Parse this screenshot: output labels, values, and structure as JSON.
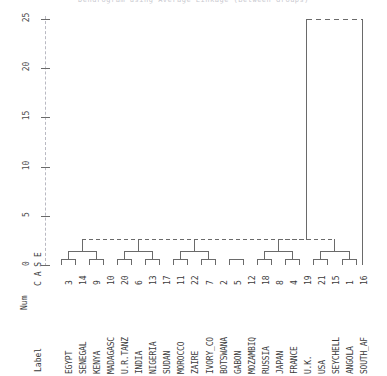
{
  "title": "Dendrogram using Average Linkage (Between Groups)",
  "header": {
    "case_label": "C A S E",
    "label_col": "Label",
    "num_col": "Num"
  },
  "chart_data": {
    "type": "dendrogram",
    "title": "Dendrogram using Average Linkage (Between Groups)",
    "xlabel": "Rescaled Distance Cluster Combine",
    "ylabel": "",
    "axis_orientation": "vertical-rescaled-distance",
    "ylim": [
      0,
      25
    ],
    "yticks": [
      0,
      5,
      10,
      15,
      20,
      25
    ],
    "ytick_labels": [
      "0",
      "5",
      "10",
      "15",
      "20",
      "25"
    ],
    "grid": false,
    "legend": "none",
    "n_cases": 22,
    "leaves": [
      {
        "label": "EGYPT",
        "num": 3
      },
      {
        "label": "SENEGAL",
        "num": 14
      },
      {
        "label": "KENYA",
        "num": 9
      },
      {
        "label": "MADAGASC",
        "num": 10
      },
      {
        "label": "U.R.TANZ",
        "num": 20
      },
      {
        "label": "INDIA",
        "num": 6
      },
      {
        "label": "NIGERIA",
        "num": 13
      },
      {
        "label": "SUDAN",
        "num": 17
      },
      {
        "label": "MOROCCO",
        "num": 11
      },
      {
        "label": "ZAIRE",
        "num": 22
      },
      {
        "label": "IVORY_CO",
        "num": 7
      },
      {
        "label": "BOTSWANA",
        "num": 2
      },
      {
        "label": "GABON",
        "num": 5
      },
      {
        "label": "MOZAMBIQ",
        "num": 12
      },
      {
        "label": "RUSSIA",
        "num": 18
      },
      {
        "label": "JAPAN",
        "num": 8
      },
      {
        "label": "FRANCE",
        "num": 4
      },
      {
        "label": "U.K.",
        "num": 19
      },
      {
        "label": "USA",
        "num": 21
      },
      {
        "label": "SEYCHELL",
        "num": 15
      },
      {
        "label": "ANGOLA",
        "num": 1
      },
      {
        "label": "SOUTH_AF",
        "num": 16
      }
    ],
    "merges": [
      {
        "left": 0,
        "right": 1,
        "height": 0.6
      },
      {
        "left": 2,
        "right": 3,
        "height": 0.6
      },
      {
        "left": 4,
        "right": 5,
        "height": 0.6
      },
      {
        "left": 6,
        "right": 7,
        "height": 0.6
      },
      {
        "left": 8,
        "right": 9,
        "height": 0.6
      },
      {
        "left": 10,
        "right": 11,
        "height": 0.6
      },
      {
        "left": 12,
        "right": 13,
        "height": 0.6
      },
      {
        "left": 14,
        "right": 15,
        "height": 0.6
      },
      {
        "left": 16,
        "right": 17,
        "height": 0.6
      },
      {
        "left": 18,
        "right": 19,
        "height": 0.6
      },
      {
        "left": 20,
        "right": 21,
        "height": 0.6
      },
      {
        "cluster_left": "a",
        "cluster_right": "b",
        "height": 1.4
      },
      {
        "cluster_left": "c",
        "cluster_right": "d",
        "height": 1.4
      },
      {
        "cluster_left": "e",
        "cluster_right": "f",
        "height": 1.4
      },
      {
        "cluster_left": "g",
        "cluster_right": "h",
        "height": 2.6
      },
      {
        "cluster_left": "i",
        "cluster_right": "j",
        "height": 25.0
      }
    ]
  },
  "colors": {
    "line": "#6a6a6a",
    "axis_dash": "#b9b9c2",
    "text": "#3a3a3a",
    "background": "#ffffff"
  }
}
